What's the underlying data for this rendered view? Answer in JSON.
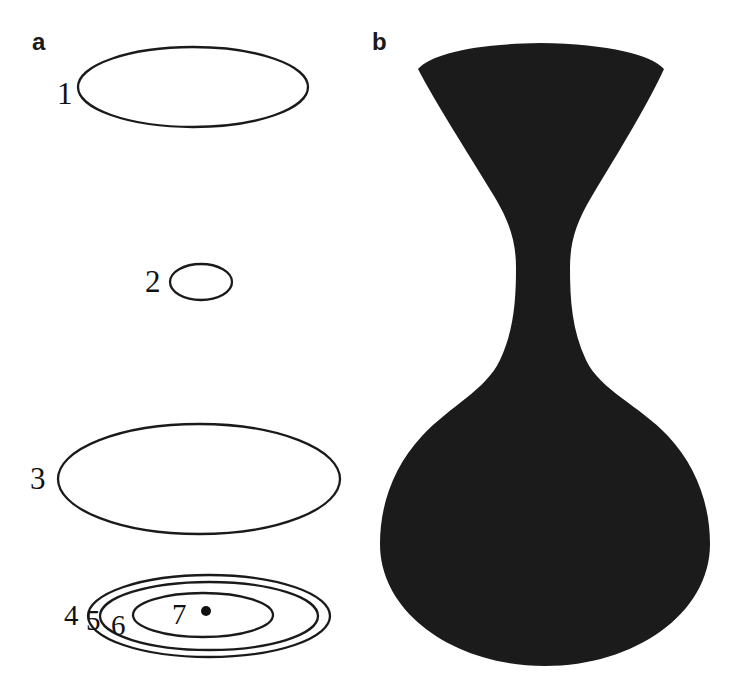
{
  "figure": {
    "width": 746,
    "height": 698,
    "background": "#ffffff",
    "stroke_color": "#1a1a1a",
    "fill_color": "#1b1b1b"
  },
  "panels": [
    {
      "id": "a",
      "label": "a",
      "description": "outline ellipses with numeric labels"
    },
    {
      "id": "b",
      "label": "b",
      "description": "solid black vase silhouette"
    }
  ],
  "panel_a": {
    "label": "a",
    "labels": [
      {
        "text": "1",
        "x": 57,
        "y": 78,
        "size": "large"
      },
      {
        "text": "2",
        "x": 145,
        "y": 266,
        "size": "large"
      },
      {
        "text": "3",
        "x": 30,
        "y": 463,
        "size": "large"
      },
      {
        "text": "4",
        "x": 64,
        "y": 601,
        "size": "small"
      },
      {
        "text": "5",
        "x": 86,
        "y": 606,
        "size": "small"
      },
      {
        "text": "6",
        "x": 111,
        "y": 611,
        "size": "small"
      },
      {
        "text": "7",
        "x": 172,
        "y": 600,
        "size": "small"
      }
    ],
    "ellipses": [
      {
        "name": "ellipse-1",
        "cx": 193,
        "cy": 87,
        "rx": 115,
        "ry": 40
      },
      {
        "name": "ellipse-2",
        "cx": 201,
        "cy": 282,
        "rx": 31,
        "ry": 18
      },
      {
        "name": "ellipse-3",
        "cx": 199,
        "cy": 479,
        "rx": 141,
        "ry": 55
      },
      {
        "name": "ellipse-4",
        "cx": 209,
        "cy": 616,
        "rx": 121,
        "ry": 41
      },
      {
        "name": "ellipse-5",
        "cx": 209,
        "cy": 616,
        "rx": 109,
        "ry": 34
      },
      {
        "name": "ellipse-6",
        "cx": 203,
        "cy": 615,
        "rx": 70,
        "ry": 22
      }
    ],
    "center_dot": {
      "name": "center-dot",
      "cx": 206,
      "cy": 611,
      "r": 5
    }
  },
  "panel_b": {
    "label": "b",
    "shape_name": "vase-silhouette",
    "fill": "#1b1b1b",
    "path": "M 418 69 C 430 55, 470 44, 540 43 C 610 44, 652 55, 664 69 C 650 100, 620 150, 592 196 C 575 224, 570 244, 570 268 C 570 300, 572 330, 586 360 C 600 390, 640 406, 668 436 C 696 466, 710 504, 710 544 C 710 614, 634 666, 545 666 C 456 666, 380 614, 380 544 C 380 504, 394 466, 422 436 C 450 406, 486 390, 500 360 C 514 330, 516 300, 516 268 C 516 244, 511 224, 494 196 C 466 150, 434 100, 418 69 Z"
  }
}
